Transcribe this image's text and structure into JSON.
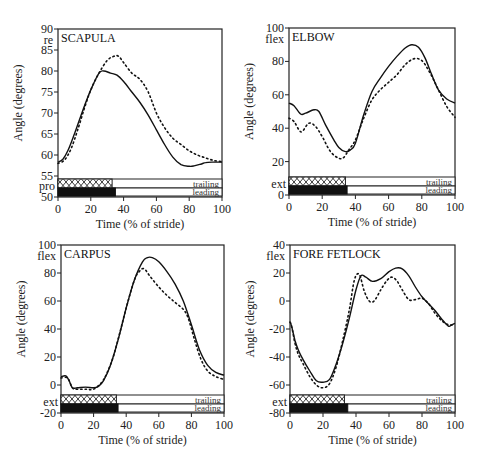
{
  "chart_data": [
    {
      "type": "line",
      "title": "SCAPULA",
      "xlabel": "Time (% of stride)",
      "ylabel": "Angle (degrees)",
      "xlim": [
        0,
        100
      ],
      "ylim": [
        50,
        90
      ],
      "xticks": [
        "0",
        "20",
        "40",
        "60",
        "80",
        "100"
      ],
      "yticks": [
        "50",
        "55",
        "60",
        "65",
        "70",
        "75",
        "80",
        "85",
        "90"
      ],
      "top_annotation": "re",
      "bottom_annotation": "pro",
      "grid": false,
      "series": [
        {
          "name": "trailing",
          "style": "solid",
          "x": [
            0,
            3,
            6,
            10,
            15,
            20,
            25,
            28,
            32,
            36,
            40,
            45,
            50,
            55,
            60,
            65,
            70,
            75,
            80,
            83,
            87,
            90,
            95,
            100
          ],
          "y": [
            58.3,
            59,
            61,
            65,
            70.5,
            75.5,
            79.5,
            80,
            79.5,
            79,
            77.5,
            75,
            72.5,
            69.5,
            66,
            62.5,
            59.5,
            57.7,
            57.3,
            57.4,
            57.8,
            58.2,
            58.3,
            58.3
          ]
        },
        {
          "name": "leading",
          "style": "dotted",
          "x": [
            0,
            4,
            8,
            12,
            16,
            20,
            25,
            30,
            34,
            37,
            40,
            45,
            50,
            55,
            60,
            65,
            70,
            75,
            80,
            85,
            90,
            95,
            100
          ],
          "y": [
            58,
            58.8,
            61.5,
            66,
            71,
            75.5,
            79.5,
            82.5,
            83.5,
            83.5,
            82,
            79.5,
            78,
            75,
            70,
            66.5,
            64,
            62.5,
            61,
            60,
            59.3,
            58.7,
            58.4
          ]
        }
      ],
      "phase_bars": [
        {
          "name": "trailing",
          "stance_end": 33,
          "pattern": "crosshatch",
          "label": "trailing"
        },
        {
          "name": "leading",
          "stance_end": 35,
          "pattern": "solid-black",
          "label": "leading"
        }
      ]
    },
    {
      "type": "line",
      "title": "ELBOW",
      "xlabel": "Time (% of stride)",
      "ylabel": "Angle (degrees)",
      "xlim": [
        0,
        100
      ],
      "ylim": [
        0,
        100
      ],
      "xticks": [
        "0",
        "20",
        "40",
        "60",
        "80",
        "100"
      ],
      "yticks": [
        "0",
        "20",
        "40",
        "60",
        "80",
        "100"
      ],
      "top_annotation": "flex",
      "bottom_annotation": "ext",
      "grid": false,
      "series": [
        {
          "name": "trailing",
          "style": "solid",
          "x": [
            0,
            3,
            7,
            10,
            15,
            18,
            22,
            27,
            30,
            34,
            37,
            40,
            45,
            50,
            55,
            60,
            65,
            70,
            74,
            78,
            82,
            86,
            90,
            95,
            100
          ],
          "y": [
            55,
            53.5,
            48.5,
            49,
            51,
            50,
            42,
            33,
            28.5,
            26,
            27,
            31,
            48,
            62,
            70,
            77,
            83,
            88,
            90,
            88.5,
            82,
            72,
            63,
            57.5,
            55
          ]
        },
        {
          "name": "leading",
          "style": "dotted",
          "x": [
            0,
            3,
            6,
            8,
            12,
            16,
            20,
            25,
            30,
            33,
            36,
            40,
            45,
            50,
            55,
            60,
            65,
            70,
            75,
            80,
            85,
            90,
            95,
            100
          ],
          "y": [
            46,
            44,
            39,
            38,
            43,
            41,
            35,
            26,
            22,
            22.5,
            27,
            33,
            46,
            57,
            63,
            67.5,
            72,
            78,
            81.5,
            80.5,
            73,
            63,
            53,
            46.5
          ]
        }
      ],
      "phase_bars": [
        {
          "name": "trailing",
          "stance_end": 34,
          "pattern": "crosshatch",
          "label": "trailing"
        },
        {
          "name": "leading",
          "stance_end": 35,
          "pattern": "solid-black",
          "label": "leading"
        }
      ]
    },
    {
      "type": "line",
      "title": "CARPUS",
      "xlabel": "Time (% of stride)",
      "ylabel": "Angle (degrees)",
      "xlim": [
        0,
        100
      ],
      "ylim": [
        -20,
        100
      ],
      "xticks": [
        "0",
        "20",
        "40",
        "60",
        "80",
        "100"
      ],
      "yticks": [
        "-20",
        "0",
        "20",
        "40",
        "60",
        "80",
        "100"
      ],
      "top_annotation": "flex",
      "bottom_annotation": "ext",
      "grid": false,
      "series": [
        {
          "name": "trailing",
          "style": "solid",
          "x": [
            0,
            3,
            5,
            7,
            10,
            15,
            20,
            23,
            26,
            30,
            35,
            40,
            45,
            50,
            53,
            56,
            60,
            65,
            70,
            75,
            80,
            85,
            90,
            95,
            100
          ],
          "y": [
            6,
            6.5,
            3,
            -2,
            -2,
            -1.5,
            -2,
            -1,
            3,
            13,
            32,
            55,
            75,
            88,
            91,
            91,
            88,
            81,
            72,
            60,
            43,
            25,
            14,
            9,
            7
          ]
        },
        {
          "name": "leading",
          "style": "dotted",
          "x": [
            0,
            4,
            7,
            10,
            15,
            20,
            25,
            28,
            32,
            36,
            40,
            45,
            48,
            51,
            55,
            60,
            65,
            70,
            75,
            78,
            82,
            86,
            90,
            95,
            100
          ],
          "y": [
            5,
            5,
            -2,
            -3,
            -3,
            -3,
            2,
            8,
            20,
            37,
            55,
            75,
            81,
            83,
            77,
            70,
            64,
            59,
            54,
            48,
            32,
            18,
            10,
            6,
            4
          ]
        }
      ],
      "phase_bars": [
        {
          "name": "trailing",
          "stance_end": 34,
          "pattern": "crosshatch",
          "label": "trailing"
        },
        {
          "name": "leading",
          "stance_end": 35,
          "pattern": "solid-black",
          "label": "leading"
        }
      ]
    },
    {
      "type": "line",
      "title": "FORE FETLOCK",
      "xlabel": "Time (% of stride)",
      "ylabel": "Angle (degrees)",
      "xlim": [
        0,
        100
      ],
      "ylim": [
        -80,
        40
      ],
      "xticks": [
        "0",
        "20",
        "40",
        "60",
        "80",
        "100"
      ],
      "yticks": [
        "-80",
        "-60",
        "-40",
        "-20",
        "0",
        "20",
        "40"
      ],
      "top_annotation": "flex",
      "bottom_annotation": "ext",
      "grid": false,
      "series": [
        {
          "name": "trailing",
          "style": "solid",
          "x": [
            0,
            1,
            3,
            5,
            8,
            12,
            16,
            20,
            24,
            28,
            32,
            36,
            40,
            43,
            46,
            50,
            55,
            60,
            64,
            68,
            72,
            76,
            80,
            84,
            88,
            92,
            96,
            98,
            100
          ],
          "y": [
            -15,
            -18,
            -28,
            -35,
            -42,
            -50,
            -57,
            -58,
            -56,
            -45,
            -30,
            -12,
            8,
            18,
            17,
            14,
            16,
            21,
            23.5,
            23,
            18,
            10,
            3,
            -2,
            -7,
            -13,
            -18,
            -17,
            -16
          ]
        },
        {
          "name": "leading",
          "style": "dotted",
          "x": [
            0,
            1,
            3,
            5,
            8,
            12,
            16,
            20,
            24,
            28,
            32,
            36,
            39,
            42,
            45,
            48,
            51,
            55,
            59,
            62,
            65,
            68,
            72,
            76,
            80,
            84,
            88,
            92,
            96,
            100
          ],
          "y": [
            -15,
            -18,
            -30,
            -38,
            -45,
            -54,
            -60,
            -62,
            -59,
            -47,
            -28,
            -6,
            15,
            19,
            7,
            0,
            0,
            8,
            15,
            17,
            14,
            8,
            1,
            1,
            2,
            -2,
            -9,
            -14,
            -17,
            -17
          ]
        }
      ],
      "phase_bars": [
        {
          "name": "trailing",
          "stance_end": 33,
          "pattern": "crosshatch",
          "label": "trailing"
        },
        {
          "name": "leading",
          "stance_end": 35,
          "pattern": "solid-black",
          "label": "leading"
        }
      ]
    }
  ],
  "panels": [
    {
      "title": "SCAPULA",
      "xlabel": "Time (% of stride)",
      "ylabel": "Angle (degrees)",
      "top": "re",
      "bottom": "pro",
      "trailing": "trailing",
      "leading": "leading"
    },
    {
      "title": "ELBOW",
      "xlabel": "Time (% of stride)",
      "ylabel": "Angle (degrees)",
      "top": "flex",
      "bottom": "ext",
      "trailing": "trailing",
      "leading": "leading"
    },
    {
      "title": "CARPUS",
      "xlabel": "Time (% of stride)",
      "ylabel": "Angle (degrees)",
      "top": "flex",
      "bottom": "ext",
      "trailing": "trailing",
      "leading": "leading"
    },
    {
      "title": "FORE FETLOCK",
      "xlabel": "Time (% of stride)",
      "ylabel": "Angle (degrees)",
      "top": "flex",
      "bottom": "ext",
      "trailing": "trailing",
      "leading": "leading"
    }
  ]
}
